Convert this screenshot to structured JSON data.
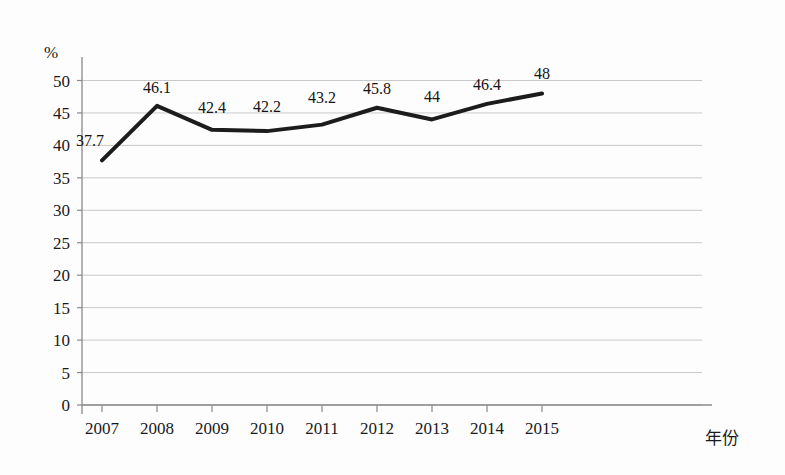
{
  "chart_data": {
    "type": "line",
    "title": "",
    "subtitle": "",
    "xlabel": "年份",
    "ylabel": "%",
    "categories": [
      "2007",
      "2008",
      "2009",
      "2010",
      "2011",
      "2012",
      "2013",
      "2014",
      "2015"
    ],
    "x": [
      2007,
      2008,
      2009,
      2010,
      2011,
      2012,
      2013,
      2014,
      2015
    ],
    "values": [
      37.7,
      46.1,
      42.4,
      42.2,
      43.2,
      45.8,
      44,
      46.4,
      48
    ],
    "point_labels": [
      "37.7",
      "46.1",
      "42.4",
      "42.2",
      "43.2",
      "45.8",
      "44",
      "46.4",
      "48"
    ],
    "series": [
      {
        "name": "",
        "values": [
          37.7,
          46.1,
          42.4,
          42.2,
          43.2,
          45.8,
          44,
          46.4,
          48
        ],
        "color": "#1c1c1c"
      }
    ],
    "ylim": [
      0,
      50
    ],
    "yticks": [
      0,
      5,
      10,
      15,
      20,
      25,
      30,
      35,
      40,
      45,
      50
    ],
    "ytick_labels": [
      "0",
      "5",
      "10",
      "15",
      "20",
      "25",
      "30",
      "35",
      "40",
      "45",
      "50"
    ],
    "grid": true,
    "grid_axis": "y",
    "grid_color": "#c9c9c9",
    "legend": false,
    "legend_position": "none",
    "line_color": "#1c1c1c",
    "line_width": 4,
    "markers": false,
    "axis_color": "#8a8a8a",
    "background_color": "#fdfdfd"
  },
  "labels": {
    "y_unit": "%",
    "x_axis_title": "年份"
  }
}
